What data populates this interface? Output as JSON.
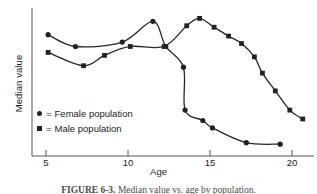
{
  "figure": {
    "caption_label": "FIGURE 6-3.",
    "caption_body": "Median value vs. age by population."
  },
  "chart_data": {
    "type": "line",
    "title": "",
    "xlabel": "Age",
    "ylabel": "Median value",
    "xlim": [
      4,
      21.5
    ],
    "ylim": [
      0,
      100
    ],
    "xticks": [
      5,
      10,
      15,
      20
    ],
    "xtick_labels": [
      "5",
      "10",
      "15",
      "20"
    ],
    "yticks": [],
    "ytick_labels": [],
    "grid": false,
    "legend_position": "inner-lower-left",
    "series": [
      {
        "name": "Female population",
        "marker": "circle",
        "legend_label": "= Female population",
        "x": [
          5.0,
          6.7,
          9.6,
          11.5,
          12.3,
          13.4,
          13.5,
          14.6,
          15.2,
          17.3,
          19.4
        ],
        "y": [
          82,
          74,
          77,
          91,
          74,
          60,
          31,
          24,
          19,
          9,
          8
        ]
      },
      {
        "name": "Male population",
        "marker": "square",
        "legend_label": "= Male population",
        "x": [
          5.0,
          7.2,
          8.5,
          10.1,
          12.2,
          13.6,
          14.4,
          15.3,
          16.2,
          17.0,
          17.8,
          18.3,
          19.1,
          20.0,
          20.8
        ],
        "y": [
          70,
          61,
          68,
          74,
          74,
          88,
          93,
          87,
          81,
          76,
          67,
          56,
          44,
          31,
          25
        ]
      }
    ]
  },
  "legend": {
    "rows": [
      {
        "marker": "circle-marker",
        "eq": "=",
        "label": "Female population"
      },
      {
        "marker": "square-marker",
        "eq": "=",
        "label": "Male population"
      }
    ]
  }
}
